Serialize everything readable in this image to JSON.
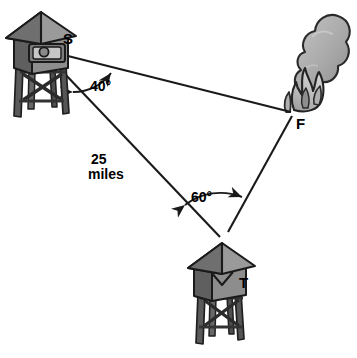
{
  "diagram": {
    "background_color": "#ffffff",
    "line_color": "#1a1a1a",
    "labels": {
      "station_s": "S",
      "station_t": "T",
      "fire": "F",
      "angle_s": "40°",
      "angle_t": "60°",
      "baseline_line1": "25",
      "baseline_line2": "miles"
    },
    "points": {
      "s": {
        "x": 42,
        "y": 52,
        "name": "S"
      },
      "t": {
        "x": 222,
        "y": 240,
        "name": "T"
      },
      "f": {
        "x": 292,
        "y": 113,
        "name": "F"
      }
    },
    "measures": {
      "angle_at_s_degrees": 40,
      "angle_at_t_degrees": 60,
      "distance_s_to_t_miles": 25
    },
    "colors": {
      "tower_roof_light": "#9a9a9a",
      "tower_roof_dark": "#6e6e6e",
      "tower_body_front": "#8d8d8d",
      "tower_body_side": "#616161",
      "tower_leg": "#555555",
      "window_frame": "#7a7a7a",
      "window_inner": "#bdbdbd",
      "smoke": "#a9a9a9",
      "smoke_light": "#c2c2c2",
      "flame": "#b8b8b8",
      "flame_dark": "#8f8f8f",
      "outline": "#1a1a1a"
    },
    "icons": {
      "tower_s": "observation-tower-icon",
      "tower_t": "observation-tower-icon",
      "fire": "fire-flame-icon",
      "smoke": "smoke-plume-icon"
    }
  }
}
